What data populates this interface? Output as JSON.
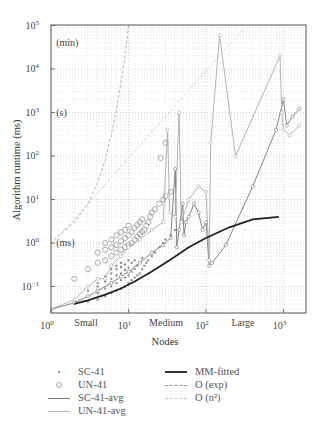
{
  "chart_data": {
    "type": "scatter",
    "title": "",
    "xlabel": "Nodes",
    "ylabel": "Algorithm runtime (ms)",
    "xscale": "log",
    "yscale": "log",
    "xlim": [
      1,
      3000
    ],
    "ylim": [
      0.025,
      100000
    ],
    "grid": true,
    "x_ticks": [
      {
        "value": 1,
        "label": "10",
        "exp": "0"
      },
      {
        "value": 10,
        "label": "10",
        "exp": "1"
      },
      {
        "value": 100,
        "label": "10",
        "exp": "2"
      },
      {
        "value": 1000,
        "label": "10",
        "exp": "3"
      }
    ],
    "y_ticks": [
      {
        "value": 0.1,
        "label": "10",
        "exp": "−1"
      },
      {
        "value": 1,
        "label": "10",
        "exp": "0"
      },
      {
        "value": 10,
        "label": "10",
        "exp": "1"
      },
      {
        "value": 100,
        "label": "10",
        "exp": "2"
      },
      {
        "value": 1000,
        "label": "10",
        "exp": "3"
      },
      {
        "value": 10000,
        "label": "10",
        "exp": "4"
      },
      {
        "value": 100000,
        "label": "10",
        "exp": "5"
      }
    ],
    "annotations": [
      {
        "text": "(min)",
        "x": 1.1,
        "y": 40000
      },
      {
        "text": "(s)",
        "x": 1.1,
        "y": 1000
      },
      {
        "text": "(ms)",
        "x": 1.1,
        "y": 1.0
      },
      {
        "text": "Small",
        "x_px": 86,
        "region": "x"
      },
      {
        "text": "Medium",
        "x_px": 166,
        "region": "x"
      },
      {
        "text": "Large",
        "x_px": 243,
        "region": "x"
      }
    ],
    "legend_position": "below",
    "series": [
      {
        "name": "SC-41",
        "style": "points",
        "marker": "dot",
        "color": "#888888",
        "points": [
          [
            2,
            0.04
          ],
          [
            2,
            0.05
          ],
          [
            3,
            0.045
          ],
          [
            3,
            0.06
          ],
          [
            3,
            0.08
          ],
          [
            4,
            0.05
          ],
          [
            4,
            0.07
          ],
          [
            4,
            0.1
          ],
          [
            4,
            0.12
          ],
          [
            5,
            0.06
          ],
          [
            5,
            0.09
          ],
          [
            5,
            0.13
          ],
          [
            5,
            0.17
          ],
          [
            6,
            0.07
          ],
          [
            6,
            0.1
          ],
          [
            6,
            0.15
          ],
          [
            6,
            0.2
          ],
          [
            6,
            0.25
          ],
          [
            7,
            0.08
          ],
          [
            7,
            0.12
          ],
          [
            7,
            0.18
          ],
          [
            7,
            0.25
          ],
          [
            7,
            0.3
          ],
          [
            8,
            0.09
          ],
          [
            8,
            0.14
          ],
          [
            8,
            0.2
          ],
          [
            8,
            0.28
          ],
          [
            8,
            0.35
          ],
          [
            9,
            0.1
          ],
          [
            9,
            0.16
          ],
          [
            9,
            0.24
          ],
          [
            9,
            0.32
          ],
          [
            10,
            0.12
          ],
          [
            10,
            0.18
          ],
          [
            10,
            0.27
          ],
          [
            10,
            0.4
          ],
          [
            11,
            0.14
          ],
          [
            11,
            0.22
          ],
          [
            11,
            0.35
          ],
          [
            12,
            0.16
          ],
          [
            12,
            0.25
          ],
          [
            12,
            0.4
          ],
          [
            13,
            0.18
          ],
          [
            13,
            0.3
          ],
          [
            14,
            0.2
          ],
          [
            14,
            0.35
          ],
          [
            15,
            0.25
          ],
          [
            15,
            0.45
          ],
          [
            16,
            0.3
          ],
          [
            17,
            0.35
          ],
          [
            18,
            0.4
          ],
          [
            20,
            0.5
          ],
          [
            22,
            0.6
          ],
          [
            25,
            0.8
          ],
          [
            28,
            1.0
          ],
          [
            30,
            1.2
          ],
          [
            35,
            1.5
          ],
          [
            40,
            2.0
          ]
        ]
      },
      {
        "name": "UN-41",
        "style": "points",
        "marker": "circle",
        "color": "#999999",
        "points": [
          [
            2,
            0.15
          ],
          [
            3,
            0.25
          ],
          [
            4,
            0.35
          ],
          [
            4,
            0.6
          ],
          [
            5,
            0.4
          ],
          [
            5,
            0.7
          ],
          [
            5,
            1.0
          ],
          [
            6,
            0.5
          ],
          [
            6,
            0.8
          ],
          [
            6,
            1.2
          ],
          [
            7,
            0.6
          ],
          [
            7,
            0.9
          ],
          [
            7,
            1.5
          ],
          [
            8,
            0.7
          ],
          [
            8,
            1.1
          ],
          [
            8,
            1.8
          ],
          [
            9,
            0.8
          ],
          [
            9,
            1.3
          ],
          [
            9,
            2.0
          ],
          [
            10,
            0.9
          ],
          [
            10,
            1.5
          ],
          [
            10,
            2.5
          ],
          [
            11,
            1.0
          ],
          [
            11,
            1.8
          ],
          [
            12,
            1.2
          ],
          [
            12,
            2.2
          ],
          [
            13,
            1.4
          ],
          [
            13,
            2.6
          ],
          [
            14,
            1.6
          ],
          [
            14,
            3.0
          ],
          [
            15,
            1.8
          ],
          [
            15,
            3.5
          ],
          [
            16,
            2.0
          ],
          [
            17,
            2.5
          ],
          [
            18,
            3.0
          ],
          [
            19,
            4.0
          ],
          [
            20,
            5.0
          ],
          [
            22,
            6.0
          ],
          [
            25,
            8.0
          ],
          [
            28,
            10.0
          ],
          [
            30,
            12.0
          ],
          [
            35,
            15.0
          ],
          [
            26,
            90
          ],
          [
            30,
            200
          ]
        ]
      },
      {
        "name": "SC-41-avg",
        "style": "line",
        "color": "#777777",
        "points": [
          [
            1,
            0.03
          ],
          [
            2,
            0.042
          ],
          [
            3,
            0.06
          ],
          [
            4,
            0.08
          ],
          [
            6,
            0.12
          ],
          [
            8,
            0.17
          ],
          [
            10,
            0.22
          ],
          [
            14,
            0.35
          ],
          [
            20,
            0.6
          ],
          [
            28,
            0.9
          ],
          [
            35,
            1.3
          ],
          [
            40,
            50
          ],
          [
            42,
            0.8
          ],
          [
            45,
            2
          ],
          [
            50,
            8
          ],
          [
            52,
            1.5
          ],
          [
            55,
            3
          ],
          [
            60,
            4
          ],
          [
            70,
            8
          ],
          [
            80,
            5
          ],
          [
            90,
            2
          ],
          [
            100,
            3
          ],
          [
            110,
            0.3
          ],
          [
            120,
            0.35
          ],
          [
            180,
            0.9
          ],
          [
            400,
            20
          ],
          [
            800,
            400
          ],
          [
            1000,
            2000
          ],
          [
            1100,
            500
          ],
          [
            1300,
            800
          ],
          [
            1600,
            1200
          ]
        ]
      },
      {
        "name": "UN-41-avg",
        "style": "line",
        "color": "#aaaaaa",
        "points": [
          [
            1,
            0.03
          ],
          [
            2,
            0.05
          ],
          [
            3,
            0.1
          ],
          [
            4,
            0.15
          ],
          [
            5,
            0.15
          ],
          [
            6,
            0.3
          ],
          [
            8,
            0.5
          ],
          [
            10,
            0.8
          ],
          [
            14,
            1.2
          ],
          [
            20,
            2
          ],
          [
            28,
            3
          ],
          [
            32,
            400
          ],
          [
            34,
            5
          ],
          [
            40,
            4
          ],
          [
            45,
            1000
          ],
          [
            48,
            3
          ],
          [
            60,
            10
          ],
          [
            80,
            20
          ],
          [
            100,
            15
          ],
          [
            110,
            0.4
          ],
          [
            115,
            200
          ],
          [
            150,
            60000
          ],
          [
            240,
            100
          ],
          [
            900,
            20000
          ],
          [
            950,
            1000
          ],
          [
            1000,
            400
          ],
          [
            1200,
            300
          ],
          [
            1600,
            500
          ]
        ]
      },
      {
        "name": "MM-fitted",
        "style": "line",
        "color": "#222222",
        "width": 1.8,
        "points": [
          [
            2,
            0.04
          ],
          [
            3,
            0.048
          ],
          [
            5,
            0.065
          ],
          [
            8,
            0.09
          ],
          [
            12,
            0.13
          ],
          [
            20,
            0.22
          ],
          [
            35,
            0.42
          ],
          [
            60,
            0.8
          ],
          [
            100,
            1.3
          ],
          [
            200,
            2.3
          ],
          [
            400,
            3.5
          ],
          [
            870,
            4.0
          ]
        ]
      },
      {
        "name": "O (exp)",
        "style": "dashed",
        "color": "#aaaaaa",
        "points": [
          [
            1.1,
            1.2
          ],
          [
            2,
            3
          ],
          [
            3,
            8
          ],
          [
            4,
            25
          ],
          [
            5,
            80
          ],
          [
            6,
            300
          ],
          [
            7,
            1200
          ],
          [
            8,
            5000
          ],
          [
            9,
            20000
          ],
          [
            10,
            100000
          ]
        ]
      },
      {
        "name": "O (n²)",
        "style": "dashed",
        "color": "#cccccc",
        "points": [
          [
            1,
            0.9
          ],
          [
            3,
            8
          ],
          [
            10,
            90
          ],
          [
            30,
            800
          ],
          [
            100,
            9000
          ],
          [
            300,
            80000
          ]
        ]
      }
    ]
  },
  "legend": {
    "left": [
      {
        "label": "SC-41",
        "swatch": "dot"
      },
      {
        "label": "UN-41",
        "swatch": "circle"
      },
      {
        "label": "SC-41-avg",
        "swatch": "line-dark"
      },
      {
        "label": "UN-41-avg",
        "swatch": "line-light"
      }
    ],
    "right": [
      {
        "label": "MM-fitted",
        "swatch": "line-thick"
      },
      {
        "label": "O (exp)",
        "swatch": "dashed-dark"
      },
      {
        "label": "O (n²)",
        "swatch": "dashed-light"
      }
    ]
  }
}
